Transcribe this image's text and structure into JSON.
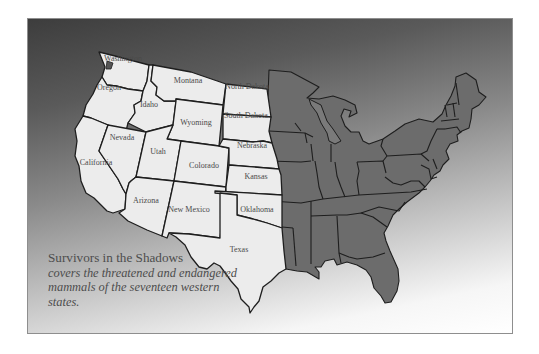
{
  "map": {
    "title": "Western United States map",
    "colors": {
      "western_states": "#ececec",
      "eastern_states": "#6c6c6c",
      "borders": "#1e1e1e",
      "background_top": "#3d3d3d",
      "background_bottom": "#ffffff"
    },
    "western_states": [
      {
        "name": "Washington"
      },
      {
        "name": "Oregon"
      },
      {
        "name": "California"
      },
      {
        "name": "Idaho"
      },
      {
        "name": "Nevada"
      },
      {
        "name": "Montana"
      },
      {
        "name": "Wyoming"
      },
      {
        "name": "Utah"
      },
      {
        "name": "Arizona"
      },
      {
        "name": "Colorado"
      },
      {
        "name": "New Mexico"
      },
      {
        "name": "North Dakota"
      },
      {
        "name": "South Dakota"
      },
      {
        "name": "Nebraska"
      },
      {
        "name": "Kansas"
      },
      {
        "name": "Oklahoma"
      },
      {
        "name": "Texas"
      }
    ]
  },
  "caption": {
    "title": "Survivors in the Shadows",
    "body": "covers the threatened and endangered mammals of the seventeen western states."
  }
}
